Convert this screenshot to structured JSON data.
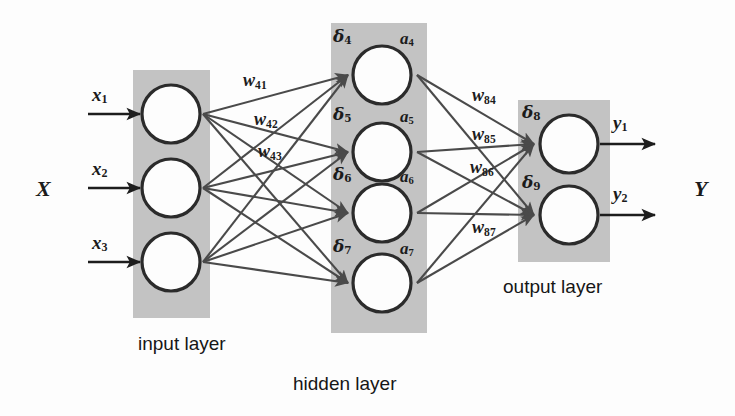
{
  "diagram": {
    "type": "neural-network",
    "colors": {
      "panel_gray": "#c3c3c3",
      "node_stroke": "#2b2b2b",
      "node_fill": "#fdfdfd",
      "connection": "#4a4a4a",
      "text": "#1b1b1b",
      "background": "#fdfdfd"
    }
  },
  "input_group": {
    "bundle_label": "X",
    "signals": [
      {
        "name": "x1",
        "base": "x",
        "sub": "1"
      },
      {
        "name": "x2",
        "base": "x",
        "sub": "2"
      },
      {
        "name": "x3",
        "base": "x",
        "sub": "3"
      }
    ]
  },
  "output_group": {
    "bundle_label": "Y",
    "signals": [
      {
        "name": "y1",
        "base": "y",
        "sub": "1"
      },
      {
        "name": "y2",
        "base": "y",
        "sub": "2"
      }
    ]
  },
  "layers": [
    {
      "id": "input",
      "caption": "input layer",
      "node_count": 3,
      "nodes": [
        {
          "id": "n1"
        },
        {
          "id": "n2"
        },
        {
          "id": "n3"
        }
      ]
    },
    {
      "id": "hidden",
      "caption": "hidden layer",
      "node_count": 4,
      "nodes": [
        {
          "id": "n4",
          "delta_base": "δ",
          "delta_sub": "4",
          "act_base": "a",
          "act_sub": "4"
        },
        {
          "id": "n5",
          "delta_base": "δ",
          "delta_sub": "5",
          "act_base": "a",
          "act_sub": "5"
        },
        {
          "id": "n6",
          "delta_base": "δ",
          "delta_sub": "6",
          "act_base": "a",
          "act_sub": "6"
        },
        {
          "id": "n7",
          "delta_base": "δ",
          "delta_sub": "7",
          "act_base": "a",
          "act_sub": "7"
        }
      ]
    },
    {
      "id": "output",
      "caption": "output layer",
      "node_count": 2,
      "nodes": [
        {
          "id": "n8",
          "delta_base": "δ",
          "delta_sub": "8"
        },
        {
          "id": "n9",
          "delta_base": "δ",
          "delta_sub": "9"
        }
      ]
    }
  ],
  "weights_input_hidden": [
    {
      "name": "w41",
      "base": "w",
      "sub": "41"
    },
    {
      "name": "w42",
      "base": "w",
      "sub": "42"
    },
    {
      "name": "w43",
      "base": "w",
      "sub": "43"
    }
  ],
  "weights_hidden_output": [
    {
      "name": "w84",
      "base": "w",
      "sub": "84"
    },
    {
      "name": "w85",
      "base": "w",
      "sub": "85"
    },
    {
      "name": "w86",
      "base": "w",
      "sub": "86"
    },
    {
      "name": "w87",
      "base": "w",
      "sub": "87"
    }
  ]
}
